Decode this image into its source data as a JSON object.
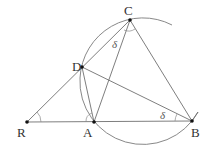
{
  "diagram": {
    "type": "geometry",
    "points": {
      "R": {
        "label": "R",
        "x": 27,
        "y": 122
      },
      "A": {
        "label": "A",
        "x": 94,
        "y": 122
      },
      "B": {
        "label": "B",
        "x": 192,
        "y": 121
      },
      "C": {
        "label": "C",
        "x": 130,
        "y": 20
      },
      "D": {
        "label": "D",
        "x": 82,
        "y": 67
      }
    },
    "segments": [
      "R-B",
      "R-C",
      "D-B",
      "C-B",
      "C-A",
      "D-A"
    ],
    "circle": {
      "through": [
        "C",
        "D",
        "A",
        "B"
      ],
      "cx": 143,
      "cy": 82,
      "r": 63
    },
    "angle_labels": {
      "at_C": "δ",
      "at_B": "δ"
    },
    "angle_marks": [
      "R",
      "A",
      "C",
      "B"
    ]
  }
}
